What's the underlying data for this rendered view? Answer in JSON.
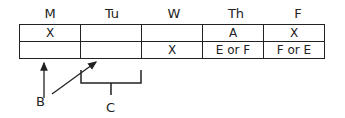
{
  "headers": [
    "M",
    "Tu",
    "W",
    "Th",
    "F"
  ],
  "rows": [
    [
      "X",
      "",
      "",
      "A",
      "X"
    ],
    [
      "",
      "",
      "X",
      "E or F",
      "F or E"
    ]
  ],
  "labels": {
    "b": "B",
    "c": "C"
  }
}
